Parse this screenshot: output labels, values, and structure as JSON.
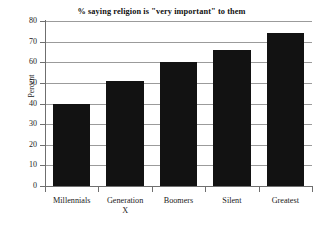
{
  "chart_data": {
    "type": "bar",
    "title": "% saying religion is \"very important\" to them",
    "xlabel": "",
    "ylabel": "Percent",
    "categories": [
      "Millennials",
      "Generation X",
      "Boomers",
      "Silent",
      "Greatest"
    ],
    "category_lines": [
      [
        "Millennials"
      ],
      [
        "Generation",
        "X"
      ],
      [
        "Boomers"
      ],
      [
        "Silent"
      ],
      [
        "Greatest"
      ]
    ],
    "values": [
      40,
      51,
      60,
      66,
      74
    ],
    "ylim": [
      0,
      80
    ],
    "ytick_labels": [
      "0",
      "10",
      "20",
      "30",
      "40",
      "50",
      "60",
      "70",
      "80"
    ],
    "ytick_values": [
      0,
      10,
      20,
      30,
      40,
      50,
      60,
      70,
      80
    ],
    "grid": true,
    "legend": "none",
    "bar_color": "#121212",
    "grid_color": "#9b9b9b",
    "axis_color": "#6f6f6f",
    "background": "#ffffff"
  }
}
